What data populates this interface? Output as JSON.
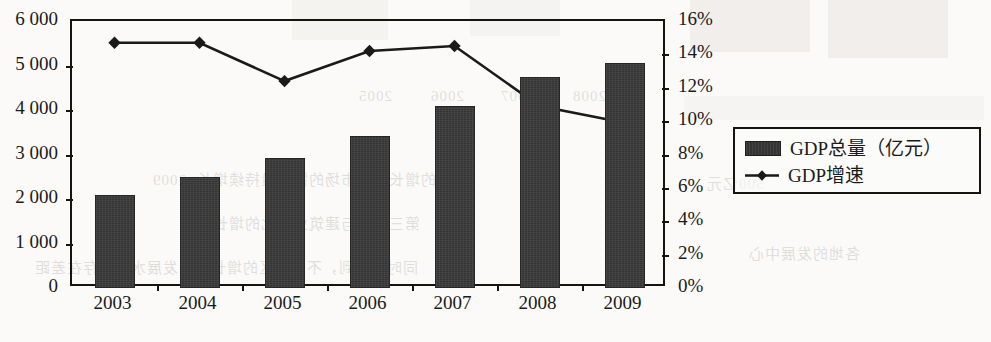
{
  "chart_data": {
    "type": "bar",
    "title": "",
    "subtitle": "",
    "xlabel": "",
    "ylabel": "",
    "grid": false,
    "legend_position": "right",
    "categories": [
      "2003",
      "2004",
      "2005",
      "2006",
      "2007",
      "2008",
      "2009"
    ],
    "series": [
      {
        "name": "GDP总量（亿元）",
        "type": "bar",
        "axis": "left",
        "color": "#343434",
        "values": [
          2100,
          2500,
          2920,
          3420,
          4100,
          4750,
          5050
        ]
      },
      {
        "name": "GDP增速",
        "type": "line",
        "axis": "right",
        "color": "#1a1a1a",
        "marker": "diamond",
        "values": [
          14.7,
          14.7,
          12.4,
          14.2,
          14.5,
          10.9,
          9.9
        ]
      }
    ],
    "left_axis": {
      "min": 0,
      "max": 6000,
      "step": 1000,
      "ticks": [
        "0",
        "1 000",
        "2 000",
        "3 000",
        "4 000",
        "5 000",
        "6 000"
      ],
      "tick_values": [
        0,
        1000,
        2000,
        3000,
        4000,
        5000,
        6000
      ]
    },
    "right_axis": {
      "min": 0,
      "max": 16,
      "step": 2,
      "ticks": [
        "0%",
        "2%",
        "4%",
        "6%",
        "8%",
        "10%",
        "12%",
        "14%",
        "16%"
      ],
      "tick_values": [
        0,
        2,
        4,
        6,
        8,
        10,
        12,
        14,
        16
      ]
    }
  },
  "legend": {
    "items": [
      {
        "label": "GDP总量（亿元）",
        "marker": "bar-swatch"
      },
      {
        "label": "GDP增速",
        "marker": "diamond-line-swatch"
      }
    ]
  },
  "scan_artifacts": {
    "ghost_lines": [
      {
        "text": "2005",
        "x": 358,
        "y": 88
      },
      {
        "text": "2006",
        "x": 430,
        "y": 88
      },
      {
        "text": "2007",
        "x": 500,
        "y": 88
      },
      {
        "text": "2008",
        "x": 572,
        "y": 88
      },
      {
        "text": "2009",
        "x": 152,
        "y": 172
      },
      {
        "text": "的增长中国市场的需求量持续增长",
        "x": 196,
        "y": 168
      },
      {
        "text": "第三产业与建筑业对比的增长率",
        "x": 196,
        "y": 212
      },
      {
        "text": "同时要看到，不同地区的增长率与发展水平仍存在差距",
        "x": 34,
        "y": 256
      },
      {
        "text": "各地的发展中心",
        "x": 748,
        "y": 242
      },
      {
        "text": "500亿元",
        "x": 706,
        "y": 172
      }
    ]
  }
}
